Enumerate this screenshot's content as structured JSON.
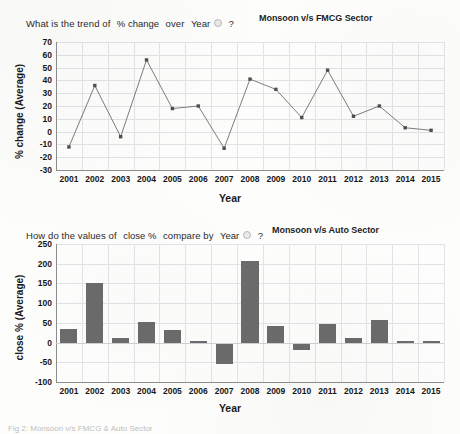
{
  "page": {
    "background_color": "#fdfdfc",
    "caption": "Fig 2: Monsoon v/s FMCG & Auto Sector"
  },
  "panels": [
    {
      "id": "fmcg",
      "question": {
        "prefix": "What is the trend of",
        "measure": "% change",
        "middle": "over",
        "dimension": "Year",
        "suffix": "?",
        "dropdown_icon": "dropdown-circle-icon"
      },
      "chart_title": "Monsoon v/s FMCG Sector"
    },
    {
      "id": "auto",
      "question": {
        "prefix": "How do the values of",
        "measure": "close %",
        "middle": "compare by",
        "dimension": "Year",
        "suffix": "?",
        "dropdown_icon": "dropdown-circle-icon"
      },
      "chart_title": "Monsoon v/s Auto Sector"
    }
  ],
  "chart_data": [
    {
      "type": "line",
      "title": "Monsoon v/s FMCG Sector",
      "xlabel": "Year",
      "ylabel": "% change (Average)",
      "ylim": [
        -30,
        70
      ],
      "yticks": [
        70,
        60,
        50,
        40,
        30,
        20,
        10,
        0,
        -10,
        -20,
        -30
      ],
      "grid": true,
      "legend": "none",
      "marker": "square",
      "line_color": "#6e6e6e",
      "categories": [
        "2001",
        "2002",
        "2003",
        "2004",
        "2005",
        "2006",
        "2007",
        "2008",
        "2009",
        "2010",
        "2011",
        "2012",
        "2013",
        "2014",
        "2015"
      ],
      "values": [
        -12,
        36,
        -4,
        56,
        18,
        20,
        -13,
        41,
        33,
        11,
        48,
        12,
        20,
        3,
        1
      ]
    },
    {
      "type": "bar",
      "title": "Monsoon v/s Auto Sector",
      "xlabel": "Year",
      "ylabel": "close % (Average)",
      "ylim": [
        -100,
        250
      ],
      "yticks": [
        250,
        200,
        150,
        100,
        50,
        0,
        -50,
        -100
      ],
      "grid": true,
      "legend": "none",
      "bar_color": "#6b6b6b",
      "categories": [
        "2001",
        "2002",
        "2003",
        "2004",
        "2005",
        "2006",
        "2007",
        "2008",
        "2009",
        "2010",
        "2011",
        "2012",
        "2013",
        "2014",
        "2015"
      ],
      "values": [
        35,
        150,
        12,
        52,
        32,
        3,
        -55,
        208,
        42,
        -18,
        46,
        12,
        58,
        3,
        4
      ]
    }
  ]
}
